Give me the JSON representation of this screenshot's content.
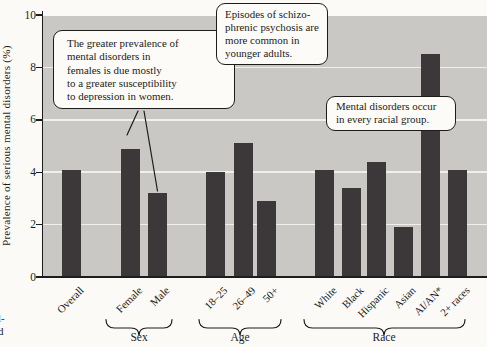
{
  "figure": {
    "y_axis_title": "Prevalence of serious mental disorders (%)",
    "margin_fragments": {
      "line1": "l-",
      "line2": "d"
    }
  },
  "chart_data": {
    "type": "bar",
    "title": "",
    "xlabel": "",
    "ylabel": "Prevalence of serious mental disorders (%)",
    "ylim": [
      0,
      10
    ],
    "yticks": [
      0,
      2,
      4,
      6,
      8,
      10
    ],
    "grid": "horizontal",
    "legend": "none",
    "plot_background": "#c9c8c5",
    "bar_color": "#3c3739",
    "categories": [
      "Overall",
      "Female",
      "Male",
      "18–25",
      "26–49",
      "50+",
      "White",
      "Black",
      "Hispanic",
      "Asian",
      "AI/AN*",
      "2+ races"
    ],
    "values": [
      4.1,
      4.9,
      3.2,
      4.0,
      5.1,
      2.9,
      4.1,
      3.4,
      4.4,
      1.9,
      8.5,
      4.1
    ],
    "groups": [
      {
        "label": "Sex",
        "members": [
          "Female",
          "Male"
        ]
      },
      {
        "label": "Age",
        "members": [
          "18–25",
          "26–49",
          "50+"
        ]
      },
      {
        "label": "Race",
        "members": [
          "White",
          "Black",
          "Hispanic",
          "Asian",
          "AI/AN*",
          "2+ races"
        ]
      }
    ],
    "annotations": [
      {
        "text": "The greater prevalence of mental disorders in females is due mostly to a greater susceptibility to depression in women.",
        "points_to": [
          "Female",
          "Male"
        ]
      },
      {
        "text": "Episodes of schizophrenic psychosis are more common in younger adults.",
        "points_to": []
      },
      {
        "text": "Mental disorders occur in every racial group.",
        "points_to": []
      }
    ]
  },
  "callouts": {
    "females": {
      "lines": [
        "The greater prevalence of",
        "mental disorders in",
        "females is due mostly",
        "to a greater susceptibility",
        "to depression in women."
      ]
    },
    "younger_adults": {
      "lines": [
        "Episodes of schizo-",
        "phrenic psychosis are",
        "more common in",
        "younger adults."
      ]
    },
    "racial_groups": {
      "lines": [
        "Mental disorders occur",
        "in every racial group."
      ]
    }
  }
}
